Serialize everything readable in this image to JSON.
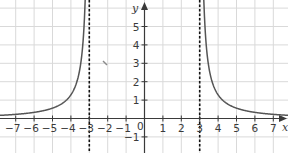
{
  "chart_data": {
    "type": "line",
    "title": "",
    "xlabel": "x",
    "ylabel": "y",
    "xlim": [
      -7.9,
      7.8
    ],
    "ylim": [
      -1.8,
      6.3
    ],
    "grid": true,
    "x_ticks": [
      -7,
      -6,
      -5,
      -4,
      -3,
      -2,
      -1,
      1,
      2,
      3,
      4,
      5,
      6,
      7
    ],
    "x_tick_labels": [
      "−7",
      "−6",
      "−5",
      "−4",
      "−3",
      "−2",
      "−1",
      "1",
      "2",
      "3",
      "4",
      "5",
      "6",
      "7"
    ],
    "y_ticks": [
      -1,
      1,
      2,
      3,
      4,
      5
    ],
    "y_tick_labels": [
      "−1",
      "1",
      "2",
      "3",
      "4",
      "5"
    ],
    "origin_label": "0",
    "asymptotes": [
      {
        "type": "vertical",
        "x": -3,
        "style": "dashed"
      },
      {
        "type": "vertical",
        "x": 3,
        "style": "dashed"
      },
      {
        "type": "horizontal",
        "y": 0
      }
    ],
    "series": [
      {
        "name": "left branch",
        "x": [
          -7.9,
          -7,
          -6,
          -5,
          -4,
          -3.5,
          -3.3,
          -3.2,
          -3.15
        ],
        "y": [
          0.17,
          0.23,
          0.33,
          0.56,
          1.29,
          2.77,
          4.76,
          7.0,
          9.0
        ]
      },
      {
        "name": "right branch",
        "x": [
          3.15,
          3.2,
          3.3,
          3.5,
          4,
          5,
          6,
          7,
          7.8
        ],
        "y": [
          9.0,
          7.0,
          4.76,
          2.77,
          1.29,
          0.56,
          0.33,
          0.23,
          0.17
        ]
      }
    ],
    "colors": {
      "curve": "#555555",
      "grid": "#d9d9d9",
      "axes": "#3a3a3a",
      "asymptote": "#111111"
    }
  }
}
